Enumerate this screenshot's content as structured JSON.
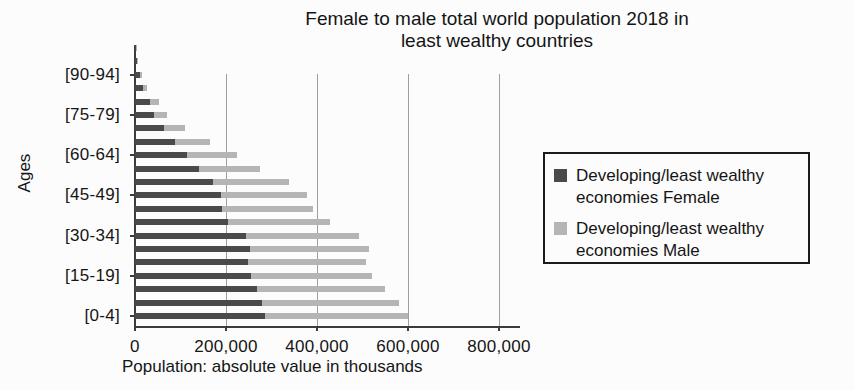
{
  "title_lines": [
    "Female to male total world population 2018 in",
    "least wealthy countries"
  ],
  "chart_data": {
    "type": "bar",
    "subtype": "horizontal-stacked",
    "title": "Female to male total world population 2018 in least wealthy countries",
    "xlabel": "Population: absolute value in thousands",
    "ylabel": "Ages",
    "grid": "vertical",
    "legend_position": "right",
    "xlim": [
      0,
      850000
    ],
    "x_ticks": [
      0,
      200000,
      400000,
      600000,
      800000
    ],
    "x_tick_labels": [
      "0",
      "200,000",
      "400,000",
      "600,000",
      "800,000"
    ],
    "categories": [
      "[0-4]",
      "[5-9]",
      "[10-14]",
      "[15-19]",
      "[20-24]",
      "[25-29]",
      "[30-34]",
      "[35-39]",
      "[40-44]",
      "[45-49]",
      "[50-54]",
      "[55-59]",
      "[60-64]",
      "[65-69]",
      "[70-74]",
      "[75-79]",
      "[80-84]",
      "[85-89]",
      "[90-94]",
      "[95-99]",
      "[100+]"
    ],
    "labeled_category_indices": [
      0,
      3,
      6,
      9,
      12,
      15,
      18
    ],
    "labeled_category_labels": [
      "[0-4]",
      "[15-19]",
      "[30-34]",
      "[45-49]",
      "[60-64]",
      "[75-79]",
      "[90-94]"
    ],
    "series": [
      {
        "name": "Developing/least wealthy economies Female",
        "color": "#4a4a4a",
        "values": [
          286000,
          279000,
          268000,
          255000,
          248000,
          253000,
          243000,
          205000,
          192000,
          189000,
          172000,
          141000,
          114000,
          88000,
          64000,
          42000,
          33000,
          18000,
          10000,
          5000,
          1500
        ]
      },
      {
        "name": "Developing/least wealthy economies Male",
        "color": "#b5b5b5",
        "values": [
          314000,
          301000,
          281000,
          266000,
          259000,
          262000,
          250000,
          224000,
          200000,
          189000,
          167000,
          134000,
          110000,
          77000,
          46000,
          29000,
          20000,
          9000,
          5000,
          2000,
          500
        ]
      }
    ]
  },
  "legend": {
    "items": [
      {
        "lines": [
          "Developing/least wealthy",
          "economies Female"
        ],
        "color": "#4a4a4a"
      },
      {
        "lines": [
          "Developing/least wealthy",
          "economies Male"
        ],
        "color": "#b5b5b5"
      }
    ]
  },
  "colors": {
    "female_bar": "#4a4a4a",
    "male_bar": "#b5b5b5",
    "gridline": "#9f9f9f",
    "axis": "#3c3c3c",
    "background": "#fcfcfc"
  }
}
